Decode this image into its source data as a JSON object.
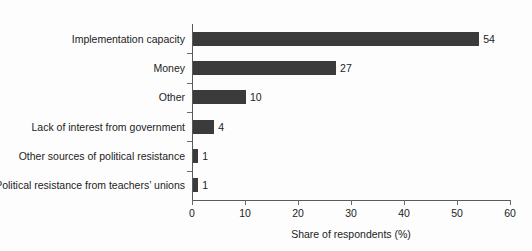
{
  "chart_data": {
    "type": "bar",
    "orientation": "horizontal",
    "title": "",
    "subtitle": "",
    "xlabel": "Share of respondents (%)",
    "ylabel": "",
    "xlim": [
      0,
      60
    ],
    "xticks": [
      0,
      10,
      20,
      30,
      40,
      50,
      60
    ],
    "xtick_labels": [
      "0",
      "10",
      "20",
      "30",
      "40",
      "50",
      "60"
    ],
    "grid": false,
    "legend": null,
    "legend_position": "none",
    "bar_color": "#3b3b3b",
    "background_color": "#fdfdfd",
    "axis_color": "#5a5a5a",
    "categories": [
      "Implementation capacity",
      "Money",
      "Other",
      "Lack of interest from government",
      "Other sources of political resistance",
      "Political resistance from teachers’ unions"
    ],
    "values": [
      54,
      27,
      10,
      4,
      1,
      1
    ],
    "value_labels": [
      "54",
      "27",
      "10",
      "4",
      "1",
      "1"
    ],
    "annotations": []
  },
  "scan_artifact": {
    "top_ghost_text": ""
  }
}
